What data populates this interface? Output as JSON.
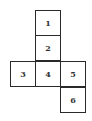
{
  "diagram": {
    "type": "cube-net",
    "line_color": "#2a2a2a",
    "faces": [
      {
        "label": "1",
        "x": 35,
        "y": 10
      },
      {
        "label": "2",
        "x": 35,
        "y": 35
      },
      {
        "label": "3",
        "x": 10,
        "y": 61
      },
      {
        "label": "4",
        "x": 35,
        "y": 61
      },
      {
        "label": "5",
        "x": 60,
        "y": 61
      },
      {
        "label": "6",
        "x": 60,
        "y": 87
      }
    ]
  }
}
